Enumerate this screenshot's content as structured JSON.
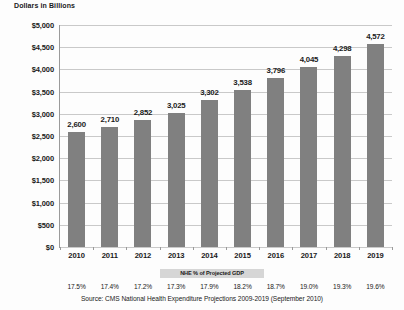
{
  "chart_data": {
    "type": "bar",
    "title": "",
    "ylabel": "Dollars in Billions",
    "xlabel": "",
    "ylim": [
      0,
      5000
    ],
    "grid": true,
    "legend": null,
    "categories": [
      "2010",
      "2011",
      "2012",
      "2013",
      "2014",
      "2015",
      "2016",
      "2017",
      "2018",
      "2019"
    ],
    "values": [
      2600,
      2710,
      2852,
      3025,
      3302,
      3538,
      3796,
      4045,
      4298,
      4572
    ],
    "data_labels": [
      "2,600",
      "2,710",
      "2,852",
      "3,025",
      "3,302",
      "3,538",
      "3,796",
      "4,045",
      "4,298",
      "4,572"
    ],
    "ytick_labels": [
      "$0",
      "$500",
      "$1,000",
      "$1,500",
      "$2,000",
      "$2,500",
      "$3,000",
      "$3,500",
      "$4,000",
      "$4,500",
      "$5,000"
    ],
    "ytick_values": [
      0,
      500,
      1000,
      1500,
      2000,
      2500,
      3000,
      3500,
      4000,
      4500,
      5000
    ],
    "secondary_row": {
      "label": "NHE % of Projected GDP",
      "values": [
        "17.5%",
        "17.4%",
        "17.2%",
        "17.3%",
        "17.9%",
        "18.2%",
        "18.7%",
        "19.0%",
        "19.3%",
        "19.6%"
      ]
    },
    "annotations": {
      "source": "Source: CMS National Health Expenditure Projections 2009-2019 (September 2010)"
    },
    "colors": {
      "bar": "#808080",
      "gridline": "#c9c9c9",
      "axis": "#9a9a9a",
      "band": "#d6d6d6",
      "text": "#1a1a1a",
      "background": "#fdfdfd"
    }
  }
}
